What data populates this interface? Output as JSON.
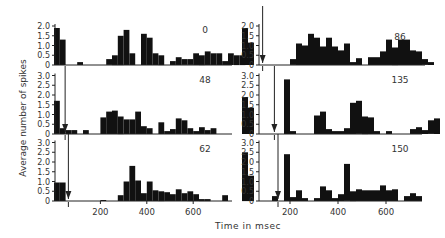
{
  "figure": {
    "ylabel": "Average number of spikes",
    "xlabel": "Time  in  msec"
  },
  "chart_data": [
    {
      "type": "bar",
      "panel": "left-top",
      "label": "0",
      "arrow_ms": null,
      "xlabel": "Time in msec",
      "ylabel": "Average number of spikes",
      "yticks": [
        "0",
        "0.5",
        "1.0",
        "1.5",
        "2.0"
      ],
      "ylim": [
        0,
        2.0
      ],
      "bin_ms": 25,
      "bins": [
        [
          0,
          1.9
        ],
        [
          25,
          1.3
        ],
        [
          100,
          0.15
        ],
        [
          225,
          0.3
        ],
        [
          250,
          0.5
        ],
        [
          275,
          1.5
        ],
        [
          300,
          1.8
        ],
        [
          325,
          0.6
        ],
        [
          375,
          1.6
        ],
        [
          400,
          1.4
        ],
        [
          425,
          0.6
        ],
        [
          450,
          0.5
        ],
        [
          500,
          0.2
        ],
        [
          525,
          0.4
        ],
        [
          550,
          0.3
        ],
        [
          575,
          0.3
        ],
        [
          600,
          0.6
        ],
        [
          625,
          0.5
        ],
        [
          650,
          0.7
        ],
        [
          675,
          0.6
        ],
        [
          700,
          0.6
        ],
        [
          725,
          0.2
        ],
        [
          750,
          0.6
        ],
        [
          775,
          0.5
        ],
        [
          800,
          0.5
        ]
      ]
    },
    {
      "type": "bar",
      "panel": "left-middle",
      "label": "48",
      "arrow_ms": 48,
      "xlabel": "Time in msec",
      "ylabel": "Average number of spikes",
      "yticks": [
        "0",
        "0.5",
        "1.0",
        "1.5",
        "2.0",
        "2.5",
        "3.0"
      ],
      "ylim": [
        0,
        3.0
      ],
      "bin_ms": 25,
      "bins": [
        [
          0,
          1.7
        ],
        [
          25,
          0.3
        ],
        [
          50,
          0.2
        ],
        [
          75,
          0.2
        ],
        [
          125,
          0.2
        ],
        [
          200,
          0.85
        ],
        [
          225,
          1.15
        ],
        [
          250,
          1.2
        ],
        [
          275,
          0.9
        ],
        [
          300,
          0.75
        ],
        [
          325,
          0.75
        ],
        [
          350,
          1.15
        ],
        [
          375,
          0.4
        ],
        [
          400,
          0.3
        ],
        [
          450,
          0.6
        ],
        [
          475,
          0.15
        ],
        [
          500,
          0.25
        ],
        [
          525,
          0.8
        ],
        [
          550,
          0.7
        ],
        [
          575,
          0.3
        ],
        [
          600,
          0.15
        ],
        [
          625,
          0.35
        ],
        [
          650,
          0.2
        ],
        [
          675,
          0.3
        ]
      ]
    },
    {
      "type": "bar",
      "panel": "left-bottom",
      "label": "62",
      "arrow_ms": 62,
      "xlabel": "Time in msec",
      "ylabel": "Average number of spikes",
      "xticks": [
        "200",
        "400",
        "600"
      ],
      "yticks": [
        "0",
        "0.5",
        "1.0",
        "1.5",
        "2.0",
        "2.5",
        "3.0"
      ],
      "ylim": [
        0,
        3.0
      ],
      "bin_ms": 25,
      "bins": [
        [
          0,
          0.95
        ],
        [
          25,
          0.95
        ],
        [
          200,
          0.05
        ],
        [
          275,
          0.3
        ],
        [
          300,
          1.0
        ],
        [
          325,
          1.8
        ],
        [
          350,
          1.05
        ],
        [
          375,
          0.4
        ],
        [
          400,
          1.0
        ],
        [
          425,
          0.55
        ],
        [
          450,
          0.5
        ],
        [
          475,
          0.45
        ],
        [
          500,
          0.35
        ],
        [
          525,
          0.6
        ],
        [
          550,
          0.4
        ],
        [
          575,
          0.5
        ],
        [
          600,
          0.35
        ],
        [
          625,
          0.1
        ],
        [
          650,
          0.1
        ],
        [
          725,
          0.3
        ]
      ]
    },
    {
      "type": "bar",
      "panel": "right-top",
      "label": "86",
      "arrow_ms": 86,
      "xlabel": "Time in msec",
      "ylabel": "Average number of spikes",
      "yticks": [
        "0",
        "0.5",
        "1.0",
        "1.5",
        "2.0"
      ],
      "ylim": [
        0,
        2.0
      ],
      "bin_ms": 25,
      "bins": [
        [
          0,
          1.9
        ],
        [
          25,
          1.15
        ],
        [
          200,
          0.3
        ],
        [
          225,
          1.1
        ],
        [
          250,
          1.0
        ],
        [
          275,
          1.6
        ],
        [
          300,
          1.4
        ],
        [
          325,
          0.95
        ],
        [
          350,
          1.4
        ],
        [
          375,
          0.95
        ],
        [
          400,
          0.75
        ],
        [
          425,
          1.1
        ],
        [
          450,
          0.15
        ],
        [
          475,
          0.35
        ],
        [
          525,
          0.4
        ],
        [
          550,
          0.4
        ],
        [
          575,
          0.7
        ],
        [
          600,
          1.3
        ],
        [
          625,
          0.9
        ],
        [
          650,
          1.3
        ],
        [
          675,
          1.3
        ],
        [
          700,
          0.75
        ],
        [
          725,
          0.7
        ],
        [
          750,
          0.3
        ],
        [
          775,
          0.15
        ]
      ]
    },
    {
      "type": "bar",
      "panel": "right-middle",
      "label": "135",
      "arrow_ms": 135,
      "xlabel": "Time in msec",
      "ylabel": "Average number of spikes",
      "yticks": [
        "0",
        "0.5",
        "1.0",
        "1.5",
        "2.0",
        "2.5",
        "3.0"
      ],
      "ylim": [
        0,
        3.0
      ],
      "bin_ms": 25,
      "bins": [
        [
          0,
          1.9
        ],
        [
          25,
          1.35
        ],
        [
          175,
          2.8
        ],
        [
          200,
          0.15
        ],
        [
          300,
          0.95
        ],
        [
          325,
          1.15
        ],
        [
          350,
          0.25
        ],
        [
          375,
          0.15
        ],
        [
          400,
          0.15
        ],
        [
          425,
          0.3
        ],
        [
          450,
          1.6
        ],
        [
          475,
          1.7
        ],
        [
          500,
          0.9
        ],
        [
          525,
          0.85
        ],
        [
          550,
          0.15
        ],
        [
          600,
          0.15
        ],
        [
          700,
          0.25
        ],
        [
          725,
          0.35
        ],
        [
          750,
          0.2
        ],
        [
          775,
          0.7
        ],
        [
          800,
          0.8
        ]
      ]
    },
    {
      "type": "bar",
      "panel": "right-bottom",
      "label": "150",
      "arrow_ms": 150,
      "xlabel": "Time in msec",
      "ylabel": "Average number of spikes",
      "xticks": [
        "200",
        "400",
        "600"
      ],
      "yticks": [
        "0",
        "0.5",
        "1.0",
        "1.5",
        "2.0",
        "2.5",
        "3.0"
      ],
      "ylim": [
        0,
        3.0
      ],
      "bin_ms": 25,
      "bins": [
        [
          0,
          2.5
        ],
        [
          25,
          1.3
        ],
        [
          125,
          0.25
        ],
        [
          175,
          2.4
        ],
        [
          200,
          0.2
        ],
        [
          225,
          0.55
        ],
        [
          250,
          0.15
        ],
        [
          300,
          0.15
        ],
        [
          325,
          0.75
        ],
        [
          350,
          0.55
        ],
        [
          375,
          0.15
        ],
        [
          400,
          0.35
        ],
        [
          425,
          1.9
        ],
        [
          450,
          0.5
        ],
        [
          475,
          0.6
        ],
        [
          500,
          0.55
        ],
        [
          525,
          0.55
        ],
        [
          550,
          0.55
        ],
        [
          575,
          0.8
        ],
        [
          600,
          0.55
        ],
        [
          625,
          0.6
        ],
        [
          675,
          0.25
        ],
        [
          700,
          0.4
        ],
        [
          725,
          0.25
        ]
      ]
    }
  ]
}
